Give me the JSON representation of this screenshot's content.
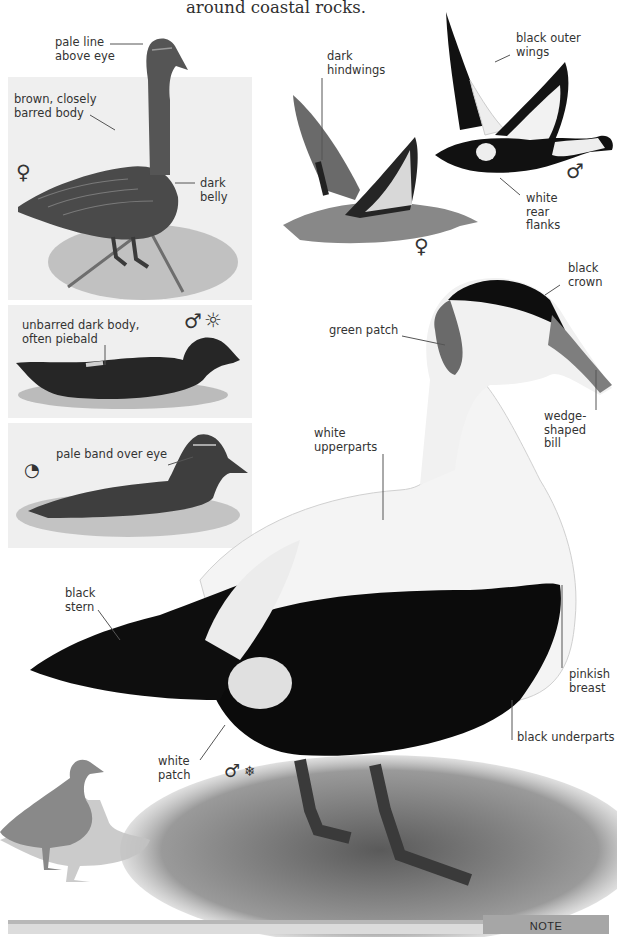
{
  "page": {
    "intro_text": "around coastal rocks.",
    "species": "Common Eider"
  },
  "panels": [
    {
      "id": "female-standing",
      "sex_symbol": "♀",
      "labels": [
        "pale line\nabove eye",
        "brown, closely\nbarred body",
        "dark\nbelly"
      ]
    },
    {
      "id": "male-eclipse",
      "sex_symbol": "♂",
      "season_symbol": "☼",
      "labels": [
        "unbarred dark body,\noften piebald"
      ]
    },
    {
      "id": "juvenile",
      "age_symbol": "◔",
      "labels": [
        "pale band over eye"
      ]
    }
  ],
  "flight": {
    "female": {
      "sex_symbol": "♀",
      "label": "dark\nhindwings"
    },
    "male": {
      "sex_symbol": "♂",
      "labels": [
        "black outer\nwings",
        "white\nrear\nflanks"
      ]
    }
  },
  "main_drake": {
    "sex_symbol": "♂",
    "season_symbol": "❄",
    "labels": {
      "crown": "black\ncrown",
      "green_patch": "green patch",
      "bill": "wedge-\nshaped\nbill",
      "upperparts": "white\nupperparts",
      "stern": "black\nstern",
      "breast": "pinkish\nbreast",
      "underparts": "black underparts",
      "white_patch": "white\npatch"
    }
  },
  "footer": {
    "note_label": "NOTE"
  },
  "colors": {
    "panel_bg": "#efefef",
    "text": "#333333",
    "note_tab": "#a6a6a6",
    "bottom_bar": "#dcdcdc",
    "silhouette": "#8a8a8a"
  }
}
